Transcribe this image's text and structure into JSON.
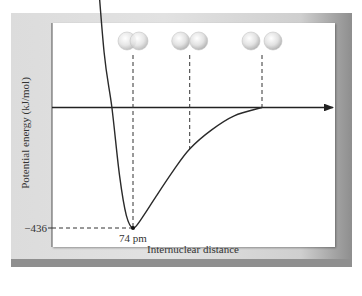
{
  "chart_data": {
    "type": "line",
    "title": "",
    "xlabel": "Internuclear distance",
    "ylabel": "Potential energy (kJ/mol)",
    "y_tick_labels": [
      "−436"
    ],
    "x_tick_labels": [
      "74 pm"
    ],
    "minimum": {
      "x_pm": 74,
      "y_kj_mol": -436
    },
    "series": [
      {
        "name": "H2 potential energy curve",
        "points_pm_kjmol": [
          [
            40,
            600
          ],
          [
            48,
            200
          ],
          [
            55,
            0
          ],
          [
            62,
            -250
          ],
          [
            68,
            -390
          ],
          [
            74,
            -436
          ],
          [
            82,
            -400
          ],
          [
            95,
            -320
          ],
          [
            110,
            -230
          ],
          [
            125,
            -150
          ],
          [
            145,
            -80
          ],
          [
            165,
            -30
          ],
          [
            190,
            0
          ]
        ]
      }
    ],
    "annotations": [
      {
        "label": "overlapping atoms",
        "x_pm": 74,
        "atoms": "overlapping"
      },
      {
        "label": "touching atoms",
        "x_pm": 125,
        "atoms": "touching"
      },
      {
        "label": "separated atoms",
        "x_pm": 190,
        "atoms": "separated"
      }
    ],
    "grid": false,
    "legend": "none",
    "colors": {
      "curve": "#2a2a2a",
      "dashed": "#333333",
      "atom": "#d8d8d8"
    }
  }
}
